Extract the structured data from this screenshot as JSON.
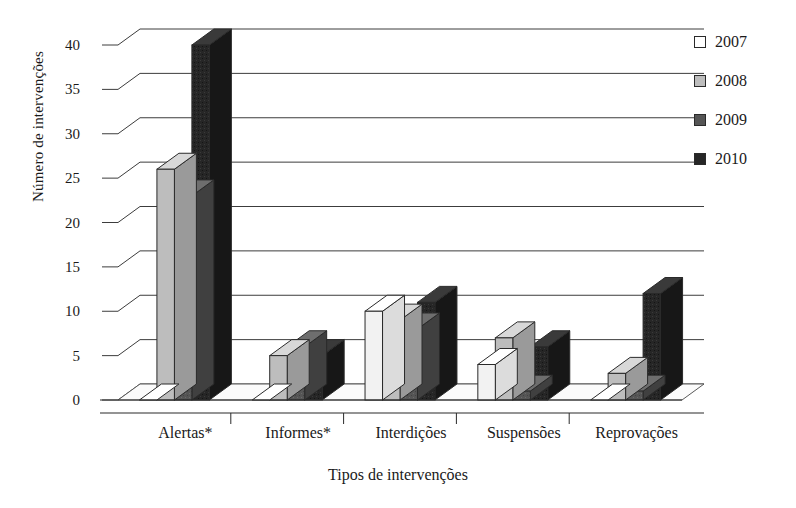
{
  "chart_data": {
    "type": "bar",
    "title": "",
    "subtitle": "",
    "xlabel": "Tipos de intervenções",
    "ylabel": "Número de intervenções",
    "categories": [
      "Alertas*",
      "Informes*",
      "Interdições",
      "Suspensões",
      "Reprovações"
    ],
    "series": [
      {
        "name": "2007",
        "color": "#f2f2f2",
        "values": [
          0,
          0,
          10,
          4,
          0
        ]
      },
      {
        "name": "2008",
        "color": "#bdbdbd",
        "values": [
          26,
          5,
          9,
          7,
          3
        ]
      },
      {
        "name": "2009",
        "color": "#555555",
        "values": [
          23,
          6,
          8,
          1,
          1
        ]
      },
      {
        "name": "2010",
        "color": "#262626",
        "values": [
          40,
          5,
          11,
          6,
          12
        ]
      }
    ],
    "yticks": [
      0,
      5,
      10,
      15,
      20,
      25,
      30,
      35,
      40
    ],
    "ylim": [
      0,
      40
    ],
    "grid": true,
    "legend_position": "right",
    "style": "3d-grouped-bar"
  },
  "legend": {
    "entries": [
      {
        "label": "2007"
      },
      {
        "label": "2008"
      },
      {
        "label": "2009"
      },
      {
        "label": "2010"
      }
    ]
  }
}
